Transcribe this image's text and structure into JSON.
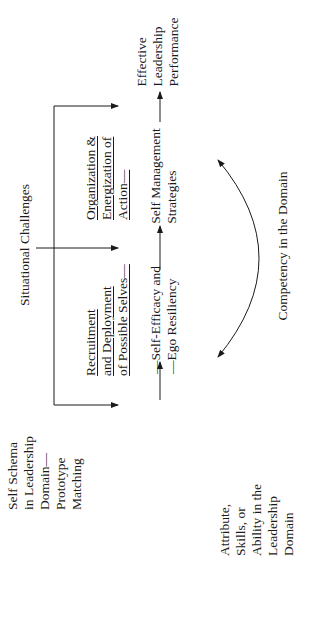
{
  "diagram": {
    "nodes": {
      "self_schema": {
        "lines": [
          "Self Schema",
          "in Leadership",
          "Domain—",
          "Prototype",
          "Matching"
        ]
      },
      "attribute": {
        "lines": [
          "Attribute,",
          "Skills, or",
          "Ability in the",
          "Leadership",
          "Domain"
        ]
      },
      "situational": {
        "lines": [
          "Situational Challenges"
        ]
      },
      "recruitment": {
        "lines": [
          "Recruitment",
          "and Deployment",
          "of Possible Selves—"
        ]
      },
      "self_efficacy": {
        "lines": [
          "—Self-Efficacy and",
          "—Ego Resiliency"
        ]
      },
      "organization": {
        "lines": [
          "Organization &",
          "Energization of",
          "Action—"
        ]
      },
      "self_management": {
        "lines": [
          "Self Management",
          "Strategies"
        ]
      },
      "effective": {
        "lines": [
          "Effective",
          "Leadership",
          "Performance"
        ]
      },
      "competency": {
        "lines": [
          "Competency in the Domain"
        ]
      }
    },
    "edges": [
      {
        "from": "self_schema",
        "to": "recruitment"
      },
      {
        "from": "situational",
        "to": "recruitment"
      },
      {
        "from": "situational",
        "to": "organization"
      },
      {
        "from": "situational",
        "to": "effective"
      },
      {
        "from": "attribute",
        "to": "self_efficacy"
      },
      {
        "from": "self_efficacy",
        "to": "self_management"
      },
      {
        "from": "self_management",
        "to": "effective"
      },
      {
        "from": "competency",
        "to": "attribute",
        "type": "bidirectional-arc"
      }
    ],
    "colors": {
      "line": "#1a1a1a",
      "background": "#ffffff"
    }
  }
}
